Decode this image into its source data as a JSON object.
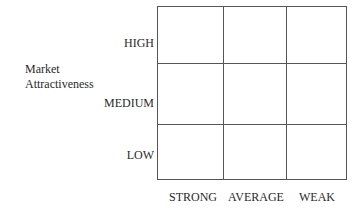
{
  "diagram": {
    "type": "3x3 matrix",
    "y_axis_label_line1": "Market",
    "y_axis_label_line2": "Attractiveness",
    "rows": [
      "HIGH",
      "MEDIUM",
      "LOW"
    ],
    "columns": [
      "STRONG",
      "AVERAGE",
      "WEAK"
    ],
    "cells": [
      [
        "",
        "",
        ""
      ],
      [
        "",
        "",
        ""
      ],
      [
        "",
        "",
        ""
      ]
    ]
  }
}
